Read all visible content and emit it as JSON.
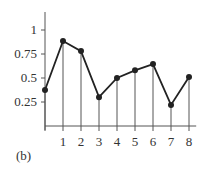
{
  "chart_data": {
    "type": "line",
    "title": "",
    "caption": "(b)",
    "xlabel": "",
    "ylabel": "",
    "x": [
      0,
      1,
      2,
      3,
      4,
      5,
      6,
      7,
      8
    ],
    "values": [
      0.375,
      0.885,
      0.78,
      0.3,
      0.5,
      0.58,
      0.645,
      0.22,
      0.51
    ],
    "x_tick_labels": [
      "1",
      "2",
      "3",
      "4",
      "5",
      "6",
      "7",
      "8"
    ],
    "y_tick_labels": [
      "0.25",
      "0.5",
      "0.75",
      "1"
    ],
    "y_ticks": [
      0.25,
      0.5,
      0.75,
      1
    ],
    "ylim": [
      0,
      1.2
    ],
    "xlim": [
      0,
      8.4
    ],
    "grid": false,
    "stems": true,
    "markers": "filled-circle",
    "legend": null
  },
  "colors": {
    "line": "#222222",
    "axis": "#555555",
    "stem": "#555555"
  }
}
